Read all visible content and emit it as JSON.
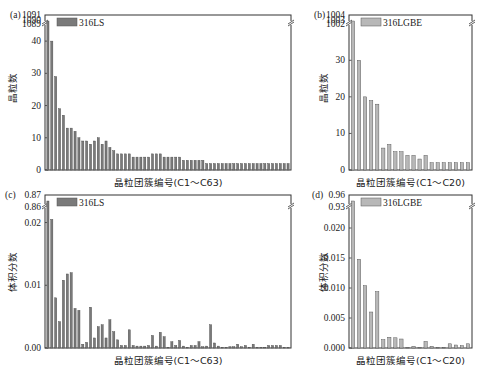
{
  "chart_data": [
    {
      "panel": "(a)",
      "type": "bar",
      "legend": "316LS",
      "bar_color": "#7a7a7a",
      "xlabel": "晶粒团簇编号(C1～C63)",
      "ylabel": "晶粒数",
      "yticks_lower": [
        "0",
        "10",
        "20",
        "30",
        "40"
      ],
      "yticks_upper": [
        "1089",
        "1090",
        "1091"
      ],
      "ylim_lower": [
        0,
        45
      ],
      "broken_axis": true,
      "values": [
        1090,
        40,
        29,
        19,
        17,
        13,
        13,
        12,
        10,
        9,
        9,
        8,
        9,
        10,
        8,
        9,
        7,
        6,
        5,
        5,
        5,
        5,
        4,
        4,
        4,
        4,
        4,
        5,
        5,
        5,
        4,
        4,
        4,
        4,
        4,
        3,
        3,
        3,
        3,
        3,
        3,
        2,
        2,
        2,
        2,
        2,
        2,
        2,
        2,
        2,
        2,
        2,
        2,
        2,
        2,
        2,
        2,
        2,
        2,
        2,
        2,
        2,
        2
      ]
    },
    {
      "panel": "(b)",
      "type": "bar",
      "legend": "316LGBE",
      "bar_color": "#b8b8b8",
      "xlabel": "晶粒团簇编号(C1～C20)",
      "ylabel": "晶粒数",
      "yticks_lower": [
        "0",
        "10",
        "20",
        "30"
      ],
      "yticks_upper": [
        "1002",
        "1003",
        "1004"
      ],
      "ylim_lower": [
        0,
        35
      ],
      "broken_axis": true,
      "values": [
        1003,
        30,
        20,
        19,
        18,
        6,
        7,
        5,
        5,
        4,
        4,
        3,
        4,
        2,
        2,
        2,
        2,
        2,
        2,
        2
      ]
    },
    {
      "panel": "(c)",
      "type": "bar",
      "legend": "316LS",
      "bar_color": "#7a7a7a",
      "xlabel": "晶粒团簇编号(C1～C63)",
      "ylabel": "体积分数",
      "yticks_lower": [
        "0.00",
        "0.01",
        "0.02"
      ],
      "yticks_upper": [
        "0.86",
        "0.87"
      ],
      "ylim_lower": [
        0,
        0.022
      ],
      "broken_axis": true,
      "values": [
        0.865,
        0.0205,
        0.008,
        0.0042,
        0.0108,
        0.0118,
        0.012,
        0.0063,
        0.006,
        0.0006,
        0.0009,
        0.0065,
        0.0016,
        0.0034,
        0.0037,
        0.0016,
        0.0045,
        0.0026,
        0.0013,
        0.0004,
        0.0004,
        0.0029,
        0.0004,
        0.0003,
        0.0003,
        0.0003,
        0.0004,
        0.002,
        0.0003,
        0.0025,
        0.0018,
        0.0001,
        0.001,
        0.0004,
        0.0012,
        0.0003,
        0.0001,
        0.0004,
        0.0004,
        0.001,
        0.0002,
        0.0003,
        0.0037,
        0.0008,
        0.0003,
        0.0001,
        0.0001,
        0.0002,
        0.0002,
        0.0006,
        0.0002,
        0.0004,
        0.0001,
        0.0006,
        0.0001,
        0.0001,
        0.0001,
        0.0004,
        0.0004,
        0.0004,
        0.0004,
        0.0001,
        0.0001
      ]
    },
    {
      "panel": "(d)",
      "type": "bar",
      "legend": "316LGBE",
      "bar_color": "#b8b8b8",
      "xlabel": "晶粒团簇编号(C1～C20)",
      "ylabel": "体积分数",
      "yticks_lower": [
        "0.000",
        "0.005",
        "0.010",
        "0.015",
        "0.020"
      ],
      "yticks_upper": [
        "0.93",
        "0.96"
      ],
      "ylim_lower": [
        0,
        0.023
      ],
      "broken_axis": true,
      "values": [
        0.945,
        0.0148,
        0.0104,
        0.006,
        0.0094,
        0.0014,
        0.0018,
        0.0017,
        0.0015,
        0.0001,
        0.0003,
        0.0001,
        0.0011,
        0.0003,
        0.0001,
        0.0001,
        0.0007,
        0.0005,
        0.0004,
        0.0007
      ]
    }
  ]
}
